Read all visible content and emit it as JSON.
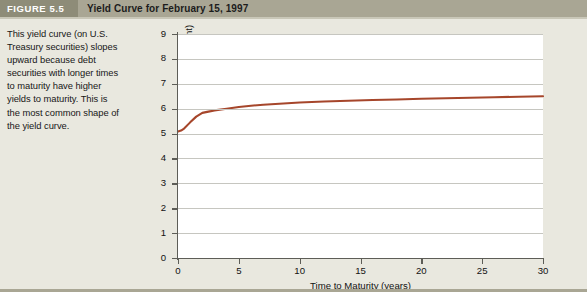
{
  "header": {
    "figure_number": "FIGURE 5.5",
    "title": "Yield Curve for February 15, 1997",
    "band_color": "#a9a694",
    "tag_color": "#8e8c78"
  },
  "caption": {
    "text": "This yield curve (on U.S. Treasury securities) slopes upward because debt securities with longer times to maturity have higher yields to maturity. This is the most common shape of the yield curve."
  },
  "chart_data": {
    "type": "line",
    "title": "Yield Curve for February 15, 1997",
    "xlabel": "Time to Maturity (years)",
    "ylabel": "Yield to Maturity (percent)",
    "xlim": [
      0,
      30
    ],
    "ylim": [
      0,
      9
    ],
    "xticks": [
      0,
      5,
      10,
      15,
      20,
      25,
      30
    ],
    "yticks": [
      0,
      1,
      2,
      3,
      4,
      5,
      6,
      7,
      8,
      9
    ],
    "grid": "horizontal",
    "legend": "none",
    "line_color": "#a6462b",
    "series": [
      {
        "name": "U.S. Treasury yield curve",
        "x": [
          0,
          0.25,
          0.5,
          1,
          1.5,
          2,
          2.5,
          3,
          4,
          5,
          6,
          7,
          8,
          9,
          10,
          12,
          14,
          16,
          18,
          20,
          22,
          24,
          26,
          28,
          30
        ],
        "values": [
          5.08,
          5.12,
          5.2,
          5.45,
          5.68,
          5.83,
          5.88,
          5.93,
          6.0,
          6.07,
          6.12,
          6.16,
          6.19,
          6.22,
          6.25,
          6.29,
          6.32,
          6.35,
          6.37,
          6.4,
          6.42,
          6.44,
          6.46,
          6.48,
          6.5
        ]
      }
    ]
  }
}
